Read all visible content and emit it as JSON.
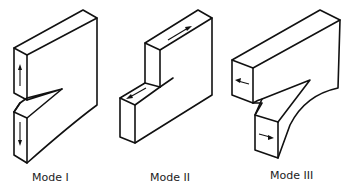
{
  "figure": {
    "panels": [
      {
        "id": "mode-1",
        "label": "Mode I",
        "description": "Opening mode: crack faces pulled apart perpendicular to crack plane",
        "arrows": [
          "up",
          "down"
        ]
      },
      {
        "id": "mode-2",
        "label": "Mode II",
        "description": "Sliding (in-plane shear) mode",
        "arrows": [
          "right",
          "left"
        ]
      },
      {
        "id": "mode-3",
        "label": "Mode III",
        "description": "Tearing (out-of-plane shear) mode",
        "arrows": [
          "left",
          "right"
        ]
      }
    ],
    "colors": {
      "stroke": "#111111",
      "background": "#ffffff",
      "text": "#222222"
    }
  }
}
